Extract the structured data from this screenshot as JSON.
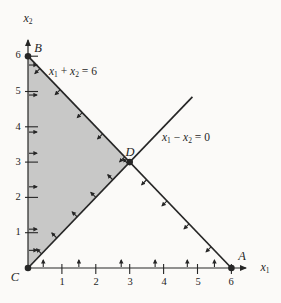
{
  "figure": {
    "background": "#fbfaf8",
    "ink_color": "#262626",
    "region_fill": "#c8c8c7",
    "axes": {
      "x_label": {
        "base": "x",
        "sub": "1"
      },
      "y_label": {
        "base": "x",
        "sub": "2"
      },
      "x_ticks": [
        "1",
        "2",
        "3",
        "4",
        "5",
        "6"
      ],
      "y_ticks": [
        "1",
        "2",
        "3",
        "4",
        "5",
        "6"
      ]
    },
    "equations": {
      "line1": {
        "v1": "x",
        "s1": "1",
        "op": " + ",
        "v2": "x",
        "s2": "2",
        "rhs": " = 6"
      },
      "line2": {
        "v1": "x",
        "s1": "1",
        "op": " − ",
        "v2": "x",
        "s2": "2",
        "rhs": " = 0"
      }
    },
    "points": [
      {
        "label": "A",
        "x": 6,
        "y": 0
      },
      {
        "label": "B",
        "x": 0,
        "y": 6
      },
      {
        "label": "C",
        "x": 0,
        "y": 0
      },
      {
        "label": "D",
        "x": 3,
        "y": 3
      }
    ],
    "lines": [
      {
        "name": "x1 + x2 = 6",
        "from": {
          "x": 0,
          "y": 6
        },
        "to": {
          "x": 6,
          "y": 0
        }
      },
      {
        "name": "x1 - x2 = 0",
        "from": {
          "x": 0,
          "y": 0
        },
        "to": {
          "x": 4.85,
          "y": 4.85
        }
      }
    ],
    "region": {
      "vertices": [
        {
          "x": 0,
          "y": 0
        },
        {
          "x": 0,
          "y": 6
        },
        {
          "x": 3,
          "y": 3
        }
      ]
    },
    "direction_arrows": {
      "x_axis_positions": [
        0.45,
        1.5,
        2.75,
        3.75,
        4.7,
        5.5
      ],
      "y_axis_positions": [
        0.5,
        1.1,
        2.3,
        3.25,
        3.85,
        4.9,
        5.75
      ],
      "line1_positions": [
        0.35,
        0.95,
        1.6,
        2.2,
        2.85,
        3.5,
        4.1,
        4.75,
        5.4
      ],
      "line2_positions": [
        0.4,
        0.85,
        1.45,
        2.0,
        2.5,
        2.95
      ]
    }
  }
}
